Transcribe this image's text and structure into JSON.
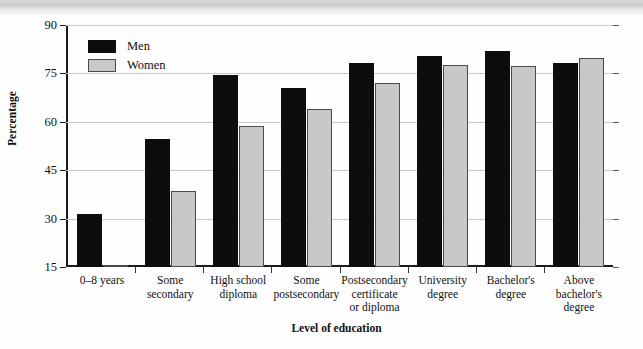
{
  "figure": {
    "y_axis_title": "Percentage",
    "x_axis_title": "Level of education"
  },
  "legend": {
    "items": [
      {
        "label": "Men",
        "color": "#0d0d0d",
        "name": "men"
      },
      {
        "label": "Women",
        "color": "#c8c8c8",
        "name": "women"
      }
    ]
  },
  "axis": {
    "y_ticks": [
      90,
      75,
      60,
      45,
      30,
      15
    ],
    "y_min": 15,
    "y_max": 90
  },
  "chart_data": {
    "type": "bar",
    "title": "",
    "xlabel": "Level of education",
    "ylabel": "Percentage",
    "ylim": [
      15,
      90
    ],
    "yticks": [
      15,
      30,
      45,
      60,
      75,
      90
    ],
    "grid": true,
    "legend_position": "upper-left-inside",
    "categories": [
      "0–8 years",
      "Some secondary",
      "High school diploma",
      "Some postsecondary",
      "Postsecondary certificate or diploma",
      "University degree",
      "Bachelor's degree",
      "Above bachelor's degree"
    ],
    "category_lines": [
      [
        "0–8 years"
      ],
      [
        "Some",
        "secondary"
      ],
      [
        "High school",
        "diploma"
      ],
      [
        "Some",
        "postsecondary"
      ],
      [
        "Postsecondary",
        "certificate",
        "or diploma"
      ],
      [
        "University",
        "degree"
      ],
      [
        "Bachelor's",
        "degree"
      ],
      [
        "Above",
        "bachelor's",
        "degree"
      ]
    ],
    "series": [
      {
        "name": "Men",
        "color": "#0d0d0d",
        "values": [
          31.5,
          54.6,
          74.5,
          70.5,
          78.3,
          80.5,
          81.8,
          78.3
        ]
      },
      {
        "name": "Women",
        "color": "#c8c8c8",
        "values": [
          15.4,
          38.7,
          58.8,
          64.0,
          72.0,
          77.5,
          77.3,
          79.8
        ]
      }
    ]
  }
}
